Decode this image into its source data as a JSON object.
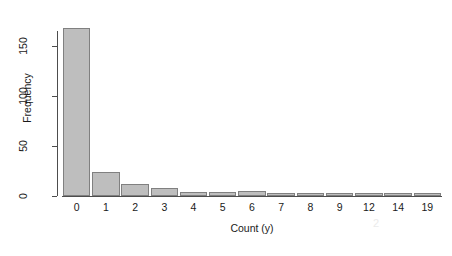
{
  "chart_data": {
    "type": "bar",
    "title": "",
    "subtitle": "",
    "xlabel": "Count (y)",
    "ylabel": "Frequency",
    "categories": [
      "0",
      "1",
      "2",
      "3",
      "4",
      "5",
      "6",
      "7",
      "8",
      "9",
      "12",
      "14",
      "19"
    ],
    "values": [
      168,
      24,
      12,
      8,
      4,
      4,
      5,
      2,
      3,
      2,
      1,
      1,
      1
    ],
    "ylim": [
      0,
      175
    ],
    "y_ticks": [
      0,
      50,
      100,
      150
    ],
    "y_tick_labels": [
      "0",
      "50",
      "100",
      "150"
    ],
    "grid": false,
    "legend": false,
    "legend_position": "none",
    "bar_fill_color": "#bebebe",
    "bar_border_color": "#808080",
    "axis_color": "#4d4d4d",
    "text_color": "#1a1a1a",
    "background_color": "#ffffff"
  },
  "artifact": {
    "mark": "2"
  }
}
